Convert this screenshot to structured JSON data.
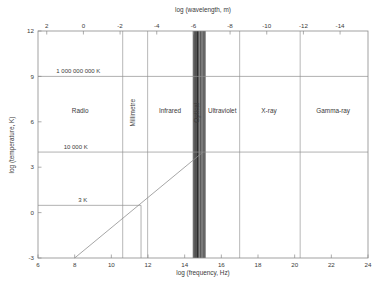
{
  "chart_data": {
    "type": "line",
    "title": "",
    "xlabel": "log (frequency, Hz)",
    "xlabel_top": "log (wavelength, m)",
    "ylabel": "log (temperature, K)",
    "xlim": [
      6,
      24
    ],
    "ylim": [
      -3,
      12
    ],
    "grid": false,
    "legend": "none",
    "x_ticks": [
      6,
      8,
      10,
      12,
      14,
      16,
      18,
      20,
      22,
      24
    ],
    "x_tick_labels": [
      "6",
      "8",
      "10",
      "12",
      "14",
      "16",
      "18",
      "20",
      "22",
      "24"
    ],
    "x_ticks_top": [
      2,
      0,
      -2,
      -4,
      -6,
      -8,
      -10,
      -12,
      -14
    ],
    "x_tick_labels_top": [
      "2",
      "0",
      "-2",
      "-4",
      "-6",
      "-8",
      "-10",
      "-12",
      "-14"
    ],
    "y_ticks": [
      12,
      9,
      6,
      3,
      0,
      -3
    ],
    "y_tick_labels": [
      "12",
      "9",
      "6",
      "3",
      "0",
      "-3"
    ],
    "series": [
      {
        "name": "Wien peak relation",
        "type": "line",
        "x": [
          8.0,
          14.99
        ],
        "y": [
          -3.0,
          3.99
        ]
      }
    ],
    "bands": [
      {
        "label": "Radio",
        "x_start": 6.0,
        "x_end": 10.62,
        "label_x": 8.3,
        "label_y": 6.6
      },
      {
        "label": "Millimetre",
        "x_start": 10.62,
        "x_end": 11.98,
        "label_x": 11.3,
        "label_y": 6.6,
        "rotated": true
      },
      {
        "label": "Infrared",
        "x_start": 11.98,
        "x_end": 14.46,
        "label_x": 13.2,
        "label_y": 6.6
      },
      {
        "label": "Optical",
        "x_start": 14.46,
        "x_end": 15.12,
        "label_x": 14.79,
        "label_y": 6.6,
        "rotated": true
      },
      {
        "label": "Ultraviolet",
        "x_start": 15.12,
        "x_end": 17.0,
        "label_x": 16.05,
        "label_y": 6.6
      },
      {
        "label": "X-ray",
        "x_start": 17.0,
        "x_end": 20.3,
        "label_x": 18.6,
        "label_y": 6.6
      },
      {
        "label": "Gamma-ray",
        "x_start": 20.3,
        "x_end": 24.0,
        "label_x": 22.1,
        "label_y": 6.6
      }
    ],
    "band_boundaries": [
      10.62,
      11.98,
      14.46,
      15.12,
      17.0,
      20.3
    ],
    "temperature_markers": [
      {
        "label": "1 000 000 000 K",
        "y": 9.0,
        "x_start": 6.0,
        "x_end": 24.0,
        "label_x": 7.0
      },
      {
        "label": "10 000 K",
        "y": 4.0,
        "x_start": 6.0,
        "x_end": 24.0,
        "label_x": 7.4
      },
      {
        "label": "3 K",
        "y": 0.48,
        "x_start": 6.0,
        "x_end": 11.62,
        "label_x": 8.2
      }
    ],
    "drop_lines": [
      {
        "x": 11.62,
        "y_top": 0.48,
        "y_bottom": -3.0
      }
    ],
    "optical_lines_x": [
      14.47,
      14.5,
      14.53,
      14.56,
      14.59,
      14.62,
      14.65,
      14.68,
      14.71,
      14.74,
      14.77,
      14.8,
      14.84,
      14.88,
      14.92,
      14.96,
      15.0,
      15.04,
      15.08,
      15.11
    ],
    "optical_line_weights": [
      0.6,
      1.4,
      0.8,
      1.9,
      0.7,
      2.2,
      0.9,
      1.1,
      2.4,
      0.8,
      1.6,
      0.7,
      1.2,
      2.0,
      0.8,
      1.5,
      0.7,
      1.8,
      0.9,
      1.3
    ]
  },
  "colors": {
    "background": "#ffffff",
    "frame": "#8a8a8a",
    "band_line": "#9a9a9a",
    "temp_line": "#8f8f8f",
    "diagonal": "#8f8f8f",
    "optical_dense": "#151515",
    "text": "#3a3a3a"
  }
}
